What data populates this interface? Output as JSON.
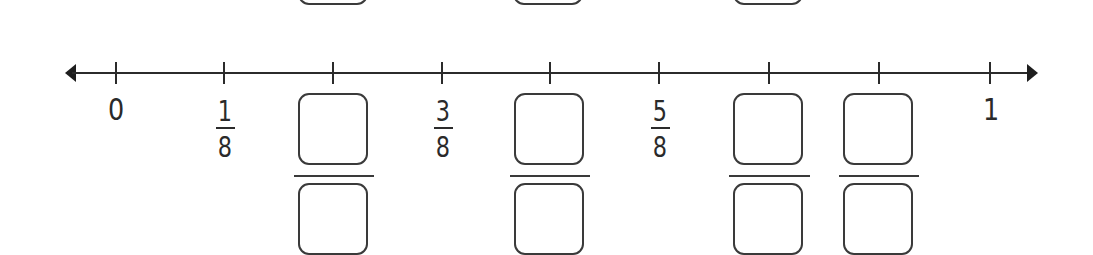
{
  "number_line": {
    "min_label": "0",
    "max_label": "1",
    "denominator": "8",
    "ticks": [
      {
        "position": "0",
        "label_type": "whole",
        "label": "0"
      },
      {
        "position": "1/8",
        "label_type": "fraction",
        "numerator": "1",
        "denominator": "8"
      },
      {
        "position": "2/8",
        "label_type": "blank-fraction"
      },
      {
        "position": "3/8",
        "label_type": "fraction",
        "numerator": "3",
        "denominator": "8"
      },
      {
        "position": "4/8",
        "label_type": "blank-fraction"
      },
      {
        "position": "5/8",
        "label_type": "fraction",
        "numerator": "5",
        "denominator": "8"
      },
      {
        "position": "6/8",
        "label_type": "blank-fraction"
      },
      {
        "position": "7/8",
        "label_type": "blank-fraction"
      },
      {
        "position": "1",
        "label_type": "whole",
        "label": "1"
      }
    ]
  },
  "labels": {
    "zero": "0",
    "one": "1",
    "f1": {
      "num": "1",
      "den": "8"
    },
    "f3": {
      "num": "3",
      "den": "8"
    },
    "f5": {
      "num": "5",
      "den": "8"
    }
  },
  "answer_boxes": {
    "b2": {
      "numerator": "",
      "denominator": ""
    },
    "b4": {
      "numerator": "",
      "denominator": ""
    },
    "b6": {
      "numerator": "",
      "denominator": ""
    },
    "b7": {
      "numerator": "",
      "denominator": ""
    }
  },
  "colors": {
    "line": "#2b2b2b",
    "background": "#ffffff"
  }
}
